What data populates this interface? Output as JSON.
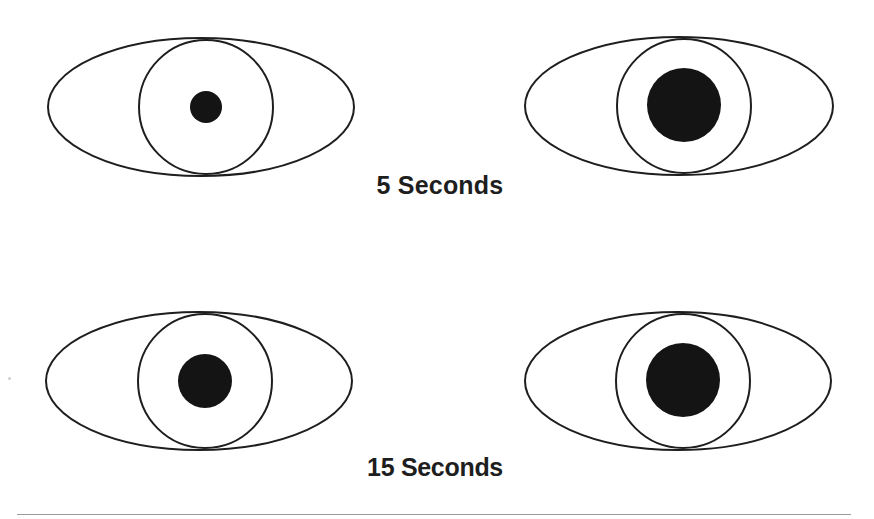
{
  "diagram": {
    "colors": {
      "outline": "#1e1e1e",
      "pupil": "#141414",
      "background": "#ffffff",
      "rule": "#9a9a9a",
      "label": "#1e1e1e"
    },
    "stroke_width": 2,
    "rows": [
      {
        "label": "5 Seconds",
        "eyes": [
          {
            "position": "left",
            "eye_outline": {
              "cx": 201,
              "cy": 107,
              "rx": 153,
              "ry": 69
            },
            "iris": {
              "cx": 206,
              "cy": 107,
              "r": 67
            },
            "pupil": {
              "cx": 206,
              "cy": 107,
              "r": 16
            }
          },
          {
            "position": "right",
            "eye_outline": {
              "cx": 679,
              "cy": 106,
              "rx": 154,
              "ry": 69
            },
            "iris": {
              "cx": 684,
              "cy": 106,
              "r": 67
            },
            "pupil": {
              "cx": 684,
              "cy": 105,
              "r": 37
            }
          }
        ]
      },
      {
        "label": "15 Seconds",
        "eyes": [
          {
            "position": "left",
            "eye_outline": {
              "cx": 199,
              "cy": 381,
              "rx": 153,
              "ry": 69
            },
            "iris": {
              "cx": 205,
              "cy": 381,
              "r": 67
            },
            "pupil": {
              "cx": 205,
              "cy": 381,
              "r": 27
            }
          },
          {
            "position": "right",
            "eye_outline": {
              "cx": 678,
              "cy": 381,
              "rx": 153,
              "ry": 69
            },
            "iris": {
              "cx": 683,
              "cy": 381,
              "r": 67
            },
            "pupil": {
              "cx": 683,
              "cy": 380,
              "r": 37
            }
          }
        ]
      }
    ]
  }
}
